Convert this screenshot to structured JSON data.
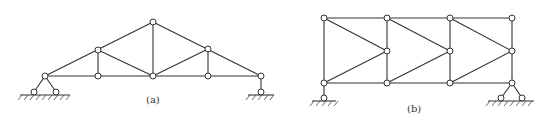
{
  "figure": {
    "panels": [
      {
        "id": "a",
        "label": "(a)",
        "type": "roof truss (triangular)"
      },
      {
        "id": "b",
        "label": "(b)",
        "type": "parallel chord truss"
      }
    ]
  },
  "labels": {
    "a": "(a)",
    "b": "(b)"
  },
  "colors": {
    "line": "#333333",
    "background": "#ffffff"
  }
}
